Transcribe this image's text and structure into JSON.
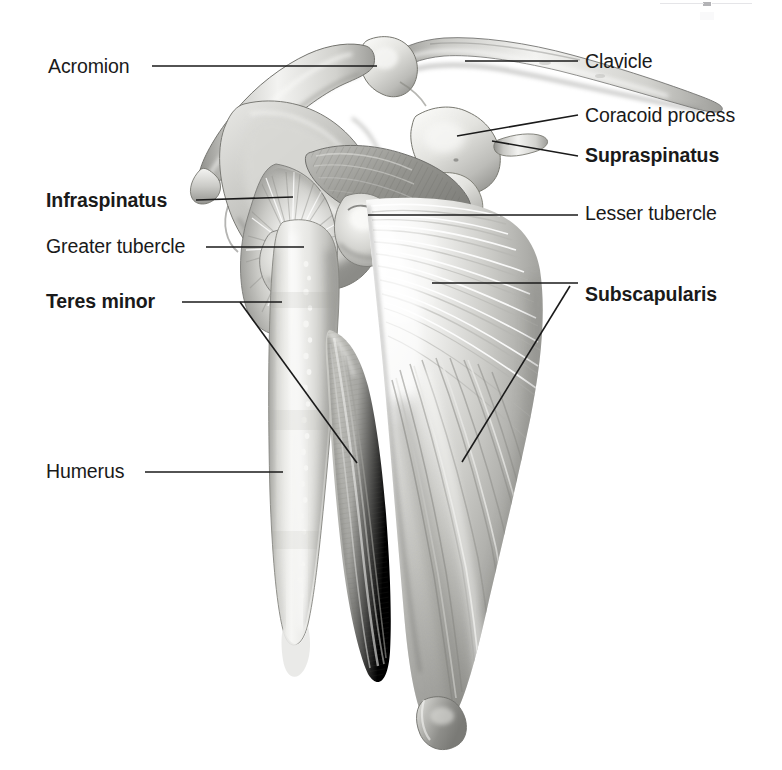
{
  "figure": {
    "colors": {
      "leader_line": "#1a1a1a",
      "text": "#1a1a1a",
      "background": "#ffffff",
      "bone_light": "#f2f2f0",
      "bone_mid": "#cfcfcb",
      "bone_shadow": "#9a9a96",
      "muscle_light": "#efefed",
      "muscle_mid": "#b9b9b6",
      "muscle_dark": "#7f7f7c"
    }
  },
  "labels": [
    {
      "id": "acromion",
      "text": "Acromion",
      "kind": "bone",
      "side": "left",
      "text_x": 48,
      "text_y": 73,
      "leader": [
        [
          152,
          66
        ],
        [
          377,
          66
        ]
      ]
    },
    {
      "id": "clavicle",
      "text": "Clavicle",
      "kind": "bone",
      "side": "right",
      "text_x": 585,
      "text_y": 68,
      "leader": [
        [
          465,
          61
        ],
        [
          578,
          61
        ]
      ]
    },
    {
      "id": "coracoid-process",
      "text": "Coracoid process",
      "kind": "bone",
      "side": "right",
      "text_x": 585,
      "text_y": 122,
      "leader": [
        [
          457,
          136
        ],
        [
          578,
          115
        ]
      ]
    },
    {
      "id": "supraspinatus",
      "text": "Supraspinatus",
      "kind": "muscle",
      "side": "right",
      "text_x": 585,
      "text_y": 162,
      "leader": [
        [
          492,
          141
        ],
        [
          578,
          156
        ]
      ]
    },
    {
      "id": "infraspinatus",
      "text": "Infraspinatus",
      "kind": "muscle",
      "side": "left",
      "text_x": 46,
      "text_y": 207,
      "leader": [
        [
          196,
          200
        ],
        [
          293,
          197
        ]
      ]
    },
    {
      "id": "lesser-tubercle",
      "text": "Lesser tubercle",
      "kind": "bone",
      "side": "right",
      "text_x": 585,
      "text_y": 220,
      "leader": [
        [
          368,
          215
        ],
        [
          578,
          215
        ]
      ]
    },
    {
      "id": "greater-tubercle",
      "text": "Greater tubercle",
      "kind": "bone",
      "side": "left",
      "text_x": 46,
      "text_y": 253,
      "leader": [
        [
          206,
          247
        ],
        [
          304,
          247
        ]
      ]
    },
    {
      "id": "teres-minor",
      "text": "Teres minor",
      "kind": "muscle",
      "side": "left",
      "text_x": 46,
      "text_y": 308,
      "leader": [
        [
          182,
          302
        ],
        [
          282,
          302
        ]
      ],
      "branch": [
        [
          240,
          302
        ],
        [
          357,
          463
        ]
      ]
    },
    {
      "id": "subscapularis",
      "text": "Subscapularis",
      "kind": "muscle",
      "side": "right",
      "text_x": 585,
      "text_y": 301,
      "leader": [
        [
          432,
          283
        ],
        [
          578,
          283
        ]
      ],
      "branch": [
        [
          570,
          286
        ],
        [
          462,
          462
        ]
      ]
    },
    {
      "id": "humerus",
      "text": "Humerus",
      "kind": "bone",
      "side": "left",
      "text_x": 46,
      "text_y": 478,
      "leader": [
        [
          145,
          472
        ],
        [
          283,
          472
        ]
      ]
    }
  ]
}
